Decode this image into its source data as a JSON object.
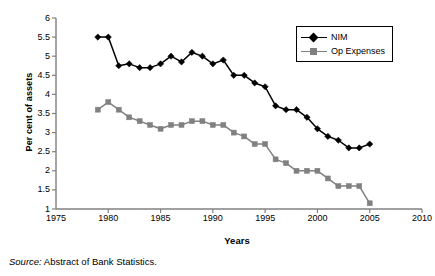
{
  "chart_data": {
    "type": "line",
    "title": "",
    "subtitle": "",
    "xlabel": "Years",
    "ylabel": "Per cent of assets",
    "xlim": [
      1975,
      2010
    ],
    "ylim": [
      1,
      6
    ],
    "xticks": [
      1975,
      1980,
      1985,
      1990,
      1995,
      2000,
      2005,
      2010
    ],
    "yticks": [
      1,
      1.5,
      2,
      2.5,
      3,
      3.5,
      4,
      4.5,
      5,
      5.5,
      6
    ],
    "grid": false,
    "legend_position": "top-right",
    "x": [
      1979,
      1980,
      1981,
      1982,
      1983,
      1984,
      1985,
      1986,
      1987,
      1988,
      1989,
      1990,
      1991,
      1992,
      1993,
      1994,
      1995,
      1996,
      1997,
      1998,
      1999,
      2000,
      2001,
      2002,
      2003,
      2004,
      2005
    ],
    "series": [
      {
        "name": "NIM",
        "color": "#000000",
        "marker": "diamond",
        "values": [
          5.5,
          5.5,
          4.75,
          4.8,
          4.7,
          4.7,
          4.8,
          5.0,
          4.85,
          5.1,
          5.0,
          4.8,
          4.9,
          4.5,
          4.5,
          4.3,
          4.2,
          3.7,
          3.6,
          3.6,
          3.4,
          3.1,
          2.9,
          2.8,
          2.6,
          2.6,
          2.7
        ]
      },
      {
        "name": "Op Expenses",
        "color": "#808080",
        "marker": "square",
        "values": [
          3.6,
          3.8,
          3.6,
          3.4,
          3.3,
          3.2,
          3.1,
          3.2,
          3.2,
          3.3,
          3.3,
          3.2,
          3.2,
          3.0,
          2.9,
          2.7,
          2.7,
          2.3,
          2.2,
          2.0,
          2.0,
          2.0,
          1.8,
          1.6,
          1.6,
          1.6,
          1.15
        ]
      }
    ]
  },
  "legend": {
    "items": [
      {
        "label": "NIM"
      },
      {
        "label": "Op Expenses"
      }
    ]
  },
  "axes": {
    "x_title": "Years",
    "y_title": "Per cent of assets"
  },
  "caption": {
    "source_word": "Source:",
    "source_text": " Abstract of Bank Statistics."
  },
  "colors": {
    "nim": "#000000",
    "op_expenses": "#808080",
    "axis": "#808080",
    "text": "#000000"
  }
}
